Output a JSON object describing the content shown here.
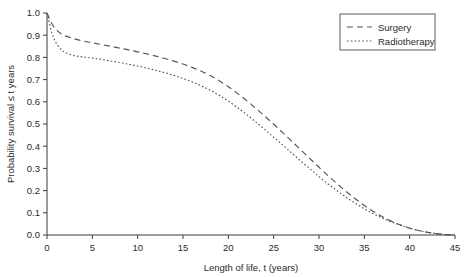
{
  "chart_data": {
    "type": "line",
    "title": "",
    "xlabel": "Length of life, t (years)",
    "ylabel": "Probability survival ≤ t years",
    "xlim": [
      0,
      45
    ],
    "ylim": [
      0.0,
      1.0
    ],
    "grid": false,
    "legend_position": "top-right",
    "xticks": [
      0,
      5,
      10,
      15,
      20,
      25,
      30,
      35,
      40,
      45
    ],
    "xtick_labels": [
      "0",
      "5",
      "10",
      "15",
      "20",
      "25",
      "30",
      "35",
      "40",
      "45"
    ],
    "yticks": [
      0.0,
      0.1,
      0.2,
      0.3,
      0.4,
      0.5,
      0.6,
      0.7,
      0.8,
      0.9,
      1.0
    ],
    "ytick_labels": [
      "0.0",
      "0.1",
      "0.2",
      "0.3",
      "0.4",
      "0.5",
      "0.6",
      "0.7",
      "0.8",
      "0.9",
      "1.0"
    ],
    "x": [
      0,
      0.5,
      1,
      1.5,
      2,
      3,
      4,
      5,
      6,
      7,
      8,
      9,
      10,
      11,
      12,
      13,
      14,
      15,
      16,
      17,
      18,
      19,
      20,
      21,
      22,
      23,
      24,
      25,
      26,
      27,
      28,
      29,
      30,
      31,
      32,
      33,
      34,
      35,
      36,
      37,
      38,
      39,
      40,
      41,
      42,
      43,
      44,
      45
    ],
    "series": [
      {
        "name": "Surgery",
        "line_style": "dashed",
        "color": "#555555",
        "values": [
          1.0,
          0.955,
          0.925,
          0.908,
          0.897,
          0.884,
          0.874,
          0.866,
          0.858,
          0.85,
          0.842,
          0.834,
          0.825,
          0.816,
          0.806,
          0.795,
          0.783,
          0.77,
          0.755,
          0.738,
          0.718,
          0.695,
          0.668,
          0.638,
          0.606,
          0.572,
          0.536,
          0.499,
          0.461,
          0.422,
          0.383,
          0.344,
          0.305,
          0.267,
          0.231,
          0.196,
          0.163,
          0.133,
          0.106,
          0.082,
          0.062,
          0.045,
          0.031,
          0.02,
          0.012,
          0.006,
          0.002,
          0.0
        ]
      },
      {
        "name": "Radiotherapy",
        "line_style": "dotted",
        "color": "#555555",
        "values": [
          1.0,
          0.915,
          0.866,
          0.838,
          0.822,
          0.808,
          0.802,
          0.797,
          0.791,
          0.784,
          0.777,
          0.769,
          0.761,
          0.752,
          0.742,
          0.731,
          0.719,
          0.705,
          0.69,
          0.672,
          0.652,
          0.629,
          0.603,
          0.574,
          0.543,
          0.51,
          0.476,
          0.441,
          0.405,
          0.369,
          0.333,
          0.298,
          0.263,
          0.23,
          0.199,
          0.17,
          0.143,
          0.118,
          0.096,
          0.076,
          0.059,
          0.044,
          0.031,
          0.02,
          0.012,
          0.006,
          0.002,
          0.0
        ]
      }
    ],
    "legend_entries": [
      {
        "label": "Surgery",
        "style": "dashed"
      },
      {
        "label": "Radiotherapy",
        "style": "dotted"
      }
    ]
  }
}
